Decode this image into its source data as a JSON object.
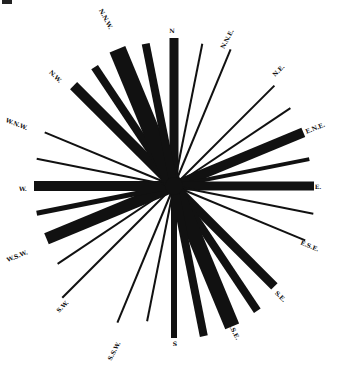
{
  "diagram": {
    "title": "",
    "type": "wind-rose",
    "center": {
      "x": 174,
      "y": 186
    },
    "ink_color": "#111111",
    "background": "#ffffff",
    "rays": [
      {
        "dir": "N",
        "angle": 0,
        "length": 148,
        "width": 9,
        "label": "N"
      },
      {
        "dir": "NbE",
        "angle": 11.25,
        "length": 145,
        "width": 2,
        "label": ""
      },
      {
        "dir": "NNE",
        "angle": 22.5,
        "length": 148,
        "width": 2,
        "label": "N.N.E."
      },
      {
        "dir": "NEbN",
        "angle": 33.75,
        "length": 0,
        "width": 0,
        "label": ""
      },
      {
        "dir": "NE",
        "angle": 45,
        "length": 142,
        "width": 2,
        "label": "N.E."
      },
      {
        "dir": "NEbE",
        "angle": 56.25,
        "length": 140,
        "width": 2,
        "label": ""
      },
      {
        "dir": "ENE",
        "angle": 67.5,
        "length": 140,
        "width": 10,
        "label": "E.N.E."
      },
      {
        "dir": "EbN",
        "angle": 78.75,
        "length": 138,
        "width": 4,
        "label": ""
      },
      {
        "dir": "E",
        "angle": 90,
        "length": 140,
        "width": 9,
        "label": "E."
      },
      {
        "dir": "EbS",
        "angle": 101.25,
        "length": 142,
        "width": 2,
        "label": ""
      },
      {
        "dir": "ESE",
        "angle": 112.5,
        "length": 142,
        "width": 2,
        "label": "E.S.E."
      },
      {
        "dir": "SEbE",
        "angle": 123.75,
        "length": 0,
        "width": 0,
        "label": ""
      },
      {
        "dir": "SE",
        "angle": 135,
        "length": 142,
        "width": 9,
        "label": "S.E."
      },
      {
        "dir": "SEbS",
        "angle": 146.25,
        "length": 150,
        "width": 8,
        "label": ""
      },
      {
        "dir": "SSE",
        "angle": 157.5,
        "length": 152,
        "width": 15,
        "label": "S.S.E."
      },
      {
        "dir": "SbE",
        "angle": 168.75,
        "length": 153,
        "width": 8,
        "label": ""
      },
      {
        "dir": "S",
        "angle": 180,
        "length": 152,
        "width": 6,
        "label": "S"
      },
      {
        "dir": "SbW",
        "angle": 191.25,
        "length": 138,
        "width": 2,
        "label": ""
      },
      {
        "dir": "SSW",
        "angle": 202.5,
        "length": 148,
        "width": 2,
        "label": "S.S.W."
      },
      {
        "dir": "SWbS",
        "angle": 213.75,
        "length": 0,
        "width": 0,
        "label": ""
      },
      {
        "dir": "SW",
        "angle": 225,
        "length": 158,
        "width": 2,
        "label": "S.W."
      },
      {
        "dir": "SWbW",
        "angle": 236.25,
        "length": 140,
        "width": 2,
        "label": ""
      },
      {
        "dir": "WSW",
        "angle": 247.5,
        "length": 138,
        "width": 12,
        "label": "W.S.W."
      },
      {
        "dir": "WbS",
        "angle": 258.75,
        "length": 140,
        "width": 5,
        "label": ""
      },
      {
        "dir": "W",
        "angle": 270,
        "length": 140,
        "width": 10,
        "label": "W."
      },
      {
        "dir": "WbN",
        "angle": 281.25,
        "length": 140,
        "width": 2,
        "label": ""
      },
      {
        "dir": "WNW",
        "angle": 292.5,
        "length": 140,
        "width": 2,
        "label": "W.N.W."
      },
      {
        "dir": "NWbW",
        "angle": 303.75,
        "length": 0,
        "width": 0,
        "label": ""
      },
      {
        "dir": "NW",
        "angle": 315,
        "length": 142,
        "width": 10,
        "label": "N.W."
      },
      {
        "dir": "NWbN",
        "angle": 326.25,
        "length": 143,
        "width": 8,
        "label": ""
      },
      {
        "dir": "NNW",
        "angle": 337.5,
        "length": 148,
        "width": 17,
        "label": "N.N.W."
      },
      {
        "dir": "NbW",
        "angle": 348.75,
        "length": 145,
        "width": 8,
        "label": ""
      }
    ],
    "labels": [
      {
        "text": "N",
        "x": 172,
        "y": 33,
        "rot": 0
      },
      {
        "text": "N.N.E.",
        "x": 229,
        "y": 40,
        "rot": -62
      },
      {
        "text": "N.E.",
        "x": 280,
        "y": 72,
        "rot": -45
      },
      {
        "text": "E.N.E.",
        "x": 316,
        "y": 130,
        "rot": -22
      },
      {
        "text": "E.",
        "x": 318,
        "y": 189,
        "rot": 0
      },
      {
        "text": "E.S.E.",
        "x": 309,
        "y": 248,
        "rot": 22
      },
      {
        "text": "S.E.",
        "x": 279,
        "y": 298,
        "rot": 45
      },
      {
        "text": "S.S.E.",
        "x": 232,
        "y": 332,
        "rot": 62
      },
      {
        "text": "S",
        "x": 175,
        "y": 346,
        "rot": 0
      },
      {
        "text": "S.S.W.",
        "x": 116,
        "y": 352,
        "rot": -62
      },
      {
        "text": "S.W.",
        "x": 64,
        "y": 308,
        "rot": -45
      },
      {
        "text": "W.S.W.",
        "x": 18,
        "y": 258,
        "rot": -22
      },
      {
        "text": "W.",
        "x": 23,
        "y": 191,
        "rot": 0
      },
      {
        "text": "W.N.W.",
        "x": 16,
        "y": 126,
        "rot": 22
      },
      {
        "text": "N.W.",
        "x": 54,
        "y": 78,
        "rot": 45
      },
      {
        "text": "N.N.W.",
        "x": 104,
        "y": 20,
        "rot": 62
      }
    ]
  }
}
